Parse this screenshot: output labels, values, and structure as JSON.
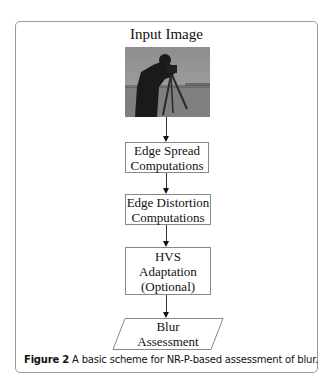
{
  "figure": {
    "caption_label": "Figure 2",
    "caption_text": " A basic scheme for NR-P-based assessment of blur."
  },
  "diagram": {
    "input": {
      "title": "Input Image",
      "image": "cameraman-grayscale-photo"
    },
    "steps": [
      {
        "lines": [
          "Edge Spread",
          "Computations"
        ]
      },
      {
        "lines": [
          "Edge Distortion",
          "Computations"
        ]
      },
      {
        "lines": [
          "HVS",
          "Adaptation",
          "(Optional)"
        ]
      }
    ],
    "output": {
      "lines": [
        "Blur",
        "Assessment"
      ],
      "shape": "parallelogram"
    },
    "colors": {
      "border": "#9a9a9a",
      "line": "#333333",
      "text": "#111111"
    }
  }
}
